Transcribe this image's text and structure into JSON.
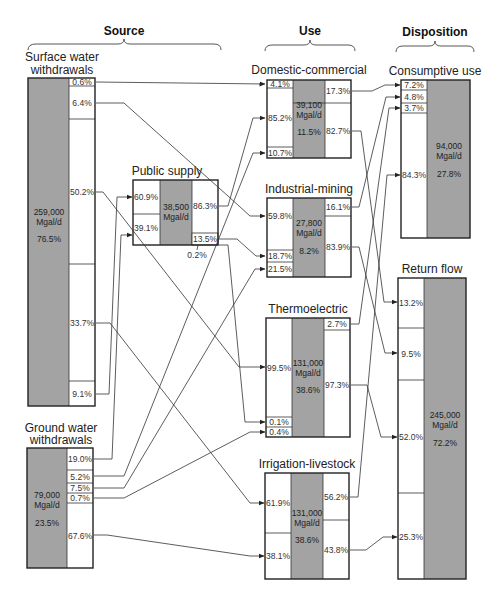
{
  "headers": {
    "source": "Source",
    "use": "Use",
    "disposition": "Disposition"
  },
  "nodes": {
    "surface": {
      "title_line1": "Surface water",
      "title_line2": "withdrawals",
      "volume": "259,000",
      "unit": "Mgal/d",
      "share": "76.5%",
      "segments": [
        "0.6%",
        "6.4%",
        "50.2%",
        "33.7%",
        "9.1%"
      ]
    },
    "ground": {
      "title_line1": "Ground water",
      "title_line2": "withdrawals",
      "volume": "79,000",
      "unit": "Mgal/d",
      "share": "23.5%",
      "segments": [
        "19.0%",
        "5.2%",
        "7.5%",
        "0.7%",
        "67.6%"
      ]
    },
    "public_supply": {
      "title": "Public supply",
      "volume": "38,500",
      "unit": "Mgal/d",
      "inputs": [
        "60.9%",
        "39.1%"
      ],
      "outputs": [
        "86.3%",
        "13.5%",
        "0.2%"
      ]
    },
    "domestic": {
      "title": "Domestic-commercial",
      "volume": "39,100",
      "unit": "Mgal/d",
      "share": "11.5%",
      "inputs": [
        "4.1%",
        "85.2%",
        "10.7%"
      ],
      "outputs": [
        "17.3%",
        "82.7%"
      ]
    },
    "industrial": {
      "title": "Industrial-mining",
      "volume": "27,800",
      "unit": "Mgal/d",
      "share": "8.2%",
      "inputs": [
        "59.8%",
        "18.7%",
        "21.5%"
      ],
      "outputs": [
        "16.1%",
        "83.9%"
      ]
    },
    "thermo": {
      "title": "Thermoelectric",
      "volume": "131,000",
      "unit": "Mgal/d",
      "share": "38.6%",
      "inputs": [
        "99.5%",
        "0.1%",
        "0.4%"
      ],
      "outputs": [
        "2.7%",
        "97.3%"
      ]
    },
    "irrigation": {
      "title": "Irrigation-livestock",
      "volume": "131,000",
      "unit": "Mgal/d",
      "share": "38.6%",
      "inputs": [
        "61.9%",
        "38.1%"
      ],
      "outputs": [
        "56.2%",
        "43.8%"
      ]
    },
    "consumptive": {
      "title": "Consumptive use",
      "volume": "94,000",
      "unit": "Mgal/d",
      "share": "27.8%",
      "inputs": [
        "7.2%",
        "4.8%",
        "3.7%",
        "84.3%"
      ]
    },
    "return": {
      "title": "Return flow",
      "volume": "245,000",
      "unit": "Mgal/d",
      "share": "72.2%",
      "inputs": [
        "13.2%",
        "9.5%",
        "52.0%",
        "25.3%"
      ]
    }
  },
  "flows": [
    {
      "from": "Surface water withdrawals",
      "to": "Domestic-commercial",
      "from_pct": "0.6%",
      "to_pct": "4.1%"
    },
    {
      "from": "Surface water withdrawals",
      "to": "Industrial-mining",
      "from_pct": "6.4%",
      "to_pct": "59.8%"
    },
    {
      "from": "Surface water withdrawals",
      "to": "Thermoelectric",
      "from_pct": "50.2%",
      "to_pct": "99.5%"
    },
    {
      "from": "Surface water withdrawals",
      "to": "Irrigation-livestock",
      "from_pct": "33.7%",
      "to_pct": "61.9%"
    },
    {
      "from": "Surface water withdrawals",
      "to": "Public supply",
      "from_pct": "9.1%",
      "to_pct": "60.9%"
    },
    {
      "from": "Ground water withdrawals",
      "to": "Public supply",
      "from_pct": "19.0%",
      "to_pct": "39.1%"
    },
    {
      "from": "Ground water withdrawals",
      "to": "Domestic-commercial",
      "from_pct": "5.2%",
      "to_pct": "10.7%"
    },
    {
      "from": "Ground water withdrawals",
      "to": "Industrial-mining",
      "from_pct": "7.5%",
      "to_pct": "21.5%"
    },
    {
      "from": "Ground water withdrawals",
      "to": "Thermoelectric",
      "from_pct": "0.7%",
      "to_pct": "0.4%"
    },
    {
      "from": "Ground water withdrawals",
      "to": "Irrigation-livestock",
      "from_pct": "67.6%",
      "to_pct": "38.1%"
    },
    {
      "from": "Public supply",
      "to": "Domestic-commercial",
      "from_pct": "86.3%",
      "to_pct": "85.2%"
    },
    {
      "from": "Public supply",
      "to": "Industrial-mining",
      "from_pct": "13.5%",
      "to_pct": "18.7%"
    },
    {
      "from": "Public supply",
      "to": "Thermoelectric",
      "from_pct": "0.2%",
      "to_pct": "0.1%"
    },
    {
      "from": "Domestic-commercial",
      "to": "Consumptive use",
      "from_pct": "17.3%",
      "to_pct": "7.2%"
    },
    {
      "from": "Domestic-commercial",
      "to": "Return flow",
      "from_pct": "82.7%",
      "to_pct": "13.2%"
    },
    {
      "from": "Industrial-mining",
      "to": "Consumptive use",
      "from_pct": "16.1%",
      "to_pct": "4.8%"
    },
    {
      "from": "Industrial-mining",
      "to": "Return flow",
      "from_pct": "83.9%",
      "to_pct": "9.5%"
    },
    {
      "from": "Thermoelectric",
      "to": "Consumptive use",
      "from_pct": "2.7%",
      "to_pct": "3.7%"
    },
    {
      "from": "Thermoelectric",
      "to": "Return flow",
      "from_pct": "97.3%",
      "to_pct": "52.0%"
    },
    {
      "from": "Irrigation-livestock",
      "to": "Consumptive use",
      "from_pct": "56.2%",
      "to_pct": "84.3%"
    },
    {
      "from": "Irrigation-livestock",
      "to": "Return flow",
      "from_pct": "43.8%",
      "to_pct": "25.3%"
    }
  ],
  "colors": {
    "box_fill_gray": "#a3a3a3",
    "line": "#333333",
    "background": "#ffffff"
  }
}
